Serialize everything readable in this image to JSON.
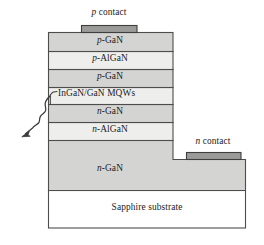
{
  "figure": {
    "kind": "led-cross-section-diagram",
    "colors": {
      "outline": "#4d4d4d",
      "layer_dark": "#d4d4d2",
      "layer_light": "#eeeeec",
      "contact_fill": "#9b9b99",
      "substrate_fill": "#ffffff",
      "text": "#1b1b1b",
      "arrow": "#3a3a3a"
    },
    "contacts": [
      {
        "id": "p-contact",
        "label_prefix": "p",
        "label_suffix": " contact",
        "label_full": "p contact",
        "x": 81,
        "y": 25,
        "w": 56,
        "h": 7,
        "text_x": 109,
        "text_y": 9
      },
      {
        "id": "n-contact",
        "label_prefix": "n",
        "label_suffix": " contact",
        "label_full": "n contact",
        "x": 186,
        "y": 152,
        "w": 55,
        "h": 7,
        "text_x": 213,
        "text_y": 138
      }
    ],
    "layers": [
      {
        "id": "p-gan-top",
        "label_prefix": "p",
        "label_suffix": "-GaN",
        "label_full": "p-GaN",
        "x": 48,
        "y": 32,
        "w": 125,
        "h": 19,
        "fill": "#d4d4d2",
        "label_x": 110,
        "label_y": 37,
        "label_align": "center"
      },
      {
        "id": "p-algan",
        "label_prefix": "p",
        "label_suffix": "-AlGaN",
        "label_full": "p-AlGaN",
        "x": 48,
        "y": 51,
        "w": 125,
        "h": 18,
        "fill": "#eeeeec",
        "label_x": 110,
        "label_y": 55,
        "label_align": "center"
      },
      {
        "id": "p-gan-lower",
        "label_prefix": "p",
        "label_suffix": "-GaN",
        "label_full": "p-GaN",
        "x": 48,
        "y": 69,
        "w": 125,
        "h": 18,
        "fill": "#d4d4d2",
        "label_x": 110,
        "label_y": 73,
        "label_align": "center"
      },
      {
        "id": "ingan-gan-mqws",
        "label_prefix": "",
        "label_suffix": "InGaN/GaN MQWs",
        "label_full": "InGaN/GaN MQWs",
        "x": 48,
        "y": 87,
        "w": 125,
        "h": 17,
        "fill": "#eeeeec",
        "label_x": 57,
        "label_y": 91,
        "label_align": "left"
      },
      {
        "id": "n-gan-upper",
        "label_prefix": "n",
        "label_suffix": "-GaN",
        "label_full": "n-GaN",
        "x": 48,
        "y": 104,
        "w": 125,
        "h": 18,
        "fill": "#d4d4d2",
        "label_x": 110,
        "label_y": 108,
        "label_align": "center"
      },
      {
        "id": "n-algan",
        "label_prefix": "n",
        "label_suffix": "-AlGaN",
        "label_full": "n-AlGaN",
        "x": 48,
        "y": 122,
        "w": 125,
        "h": 18,
        "fill": "#eeeeec",
        "label_x": 110,
        "label_y": 126,
        "label_align": "center"
      },
      {
        "id": "n-gan-base",
        "label_prefix": "n",
        "label_suffix": "-GaN",
        "label_full": "n-GaN",
        "x": 48,
        "y": 140,
        "w": 198,
        "h": 50,
        "fill": "#d4d4d2",
        "label_x": 110,
        "label_y": 165,
        "label_align": "center",
        "shape": "stepped",
        "mesa_right": 173,
        "step_y": 159
      },
      {
        "id": "sapphire-substrate",
        "label_prefix": "",
        "label_suffix": "Sapphire substrate",
        "label_full": "Sapphire substrate",
        "x": 48,
        "y": 190,
        "w": 198,
        "h": 38,
        "fill": "#ffffff",
        "label_x": 147,
        "label_y": 204,
        "label_align": "center"
      }
    ],
    "annotations": [
      {
        "id": "mqw-leader",
        "kind": "leader-line",
        "path": "M 56.5 91.5 L 52.5 92.5 L 50.5 95.0 L 50.5 104.0"
      },
      {
        "id": "light-emission-arrow",
        "kind": "wavy-arrow",
        "meaning": "emitted light",
        "path": "M 50 96 C 47 99, 45.5 101, 45 104 C 44.5 107, 46 108.5, 45.5 111 C 45 113.5, 42 114, 40.5 116.5 C 39 119, 40 121, 38.5 123 C 37 125, 34 125.5, 32.5 128",
        "arrow_tip": {
          "x": 22.5,
          "y": 136.5
        },
        "arrow_tail": {
          "x": 32.5,
          "y": 128
        }
      }
    ]
  }
}
